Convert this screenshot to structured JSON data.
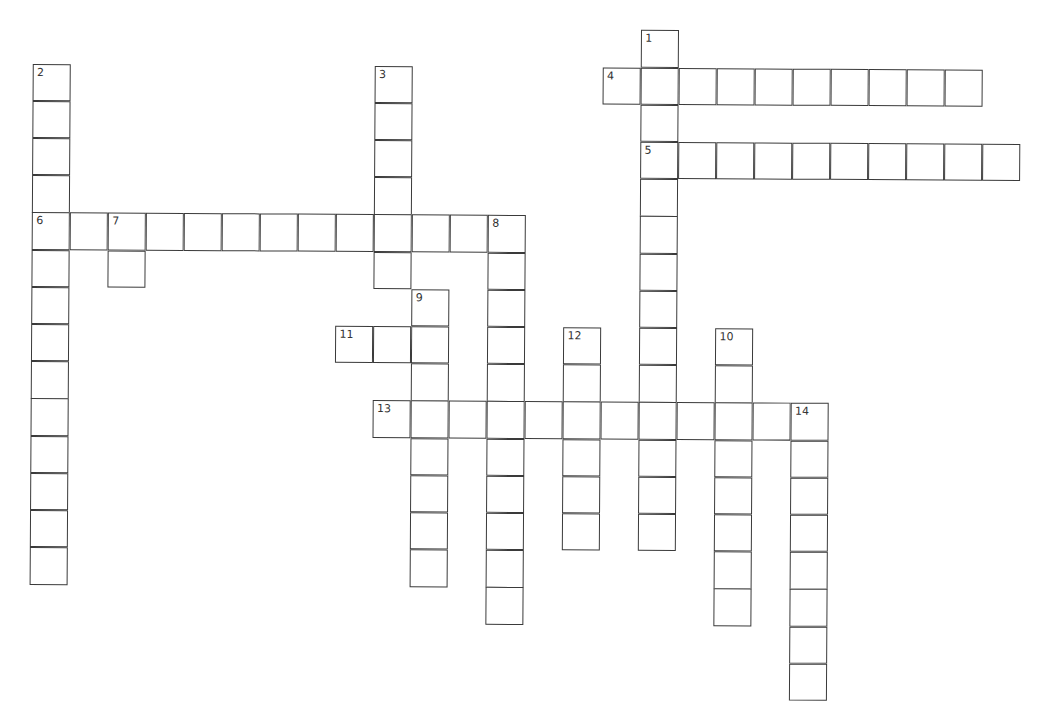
{
  "puzzle": {
    "type": "crossword",
    "cell_width": 38,
    "cell_height": 37.2,
    "origin_x": 34,
    "origin_y": 27,
    "line_color": "#3a3a3a",
    "entries": [
      {
        "number": "1",
        "direction": "down",
        "row": 0,
        "col": 16,
        "length": 14
      },
      {
        "number": "2",
        "direction": "down",
        "row": 1,
        "col": 0,
        "length": 14
      },
      {
        "number": "3",
        "direction": "down",
        "row": 1,
        "col": 9,
        "length": 6
      },
      {
        "number": "4",
        "direction": "across",
        "row": 1,
        "col": 15,
        "length": 10
      },
      {
        "number": "5",
        "direction": "across",
        "row": 3,
        "col": 16,
        "length": 10
      },
      {
        "number": "6",
        "direction": "across",
        "row": 5,
        "col": 0,
        "length": 13
      },
      {
        "number": "7",
        "direction": "down",
        "row": 5,
        "col": 2,
        "length": 2
      },
      {
        "number": "8",
        "direction": "down",
        "row": 5,
        "col": 12,
        "length": 11
      },
      {
        "number": "9",
        "direction": "down",
        "row": 7,
        "col": 10,
        "length": 8
      },
      {
        "number": "10",
        "direction": "down",
        "row": 8,
        "col": 18,
        "length": 8
      },
      {
        "number": "11",
        "direction": "across",
        "row": 8,
        "col": 8,
        "length": 3
      },
      {
        "number": "12",
        "direction": "down",
        "row": 8,
        "col": 14,
        "length": 6
      },
      {
        "number": "13",
        "direction": "across",
        "row": 10,
        "col": 9,
        "length": 12
      },
      {
        "number": "14",
        "direction": "down",
        "row": 10,
        "col": 20,
        "length": 8
      }
    ]
  }
}
